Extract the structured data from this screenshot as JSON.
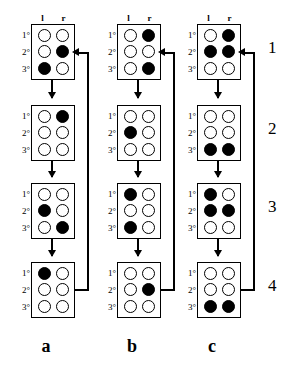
{
  "figure": {
    "panel_labels": [
      "a",
      "b",
      "c"
    ],
    "stage_numbers": [
      "1",
      "2",
      "3",
      "4"
    ],
    "column_headers": [
      "l",
      "r"
    ],
    "row_labels": [
      "1°",
      "2°",
      "3°"
    ],
    "colors": {
      "filled_dot": "#000000",
      "empty_dot": "#ffffff",
      "stroke": "#000000",
      "background": "#ffffff"
    },
    "glyph_names": {
      "down_arrow": "down-arrow-icon",
      "feedback_arrow": "feedback-arrow-icon",
      "filled_dot": "filled-dot-icon",
      "empty_dot": "empty-dot-icon"
    }
  },
  "panels": [
    {
      "label": "a",
      "stages": [
        {
          "stage": "1",
          "rows": [
            [
              0,
              0
            ],
            [
              0,
              1
            ],
            [
              1,
              0
            ]
          ]
        },
        {
          "stage": "2",
          "rows": [
            [
              0,
              1
            ],
            [
              0,
              0
            ],
            [
              0,
              0
            ]
          ]
        },
        {
          "stage": "3",
          "rows": [
            [
              0,
              0
            ],
            [
              1,
              0
            ],
            [
              0,
              1
            ]
          ]
        },
        {
          "stage": "4",
          "rows": [
            [
              1,
              0
            ],
            [
              0,
              0
            ],
            [
              0,
              0
            ]
          ]
        }
      ]
    },
    {
      "label": "b",
      "stages": [
        {
          "stage": "1",
          "rows": [
            [
              0,
              1
            ],
            [
              0,
              0
            ],
            [
              0,
              1
            ]
          ]
        },
        {
          "stage": "2",
          "rows": [
            [
              0,
              0
            ],
            [
              1,
              0
            ],
            [
              0,
              0
            ]
          ]
        },
        {
          "stage": "3",
          "rows": [
            [
              1,
              0
            ],
            [
              0,
              0
            ],
            [
              1,
              0
            ]
          ]
        },
        {
          "stage": "4",
          "rows": [
            [
              0,
              0
            ],
            [
              0,
              1
            ],
            [
              0,
              0
            ]
          ]
        }
      ]
    },
    {
      "label": "c",
      "stages": [
        {
          "stage": "1",
          "rows": [
            [
              0,
              1
            ],
            [
              1,
              1
            ],
            [
              0,
              0
            ]
          ]
        },
        {
          "stage": "2",
          "rows": [
            [
              0,
              0
            ],
            [
              0,
              0
            ],
            [
              1,
              1
            ]
          ]
        },
        {
          "stage": "3",
          "rows": [
            [
              1,
              0
            ],
            [
              1,
              1
            ],
            [
              0,
              0
            ]
          ]
        },
        {
          "stage": "4",
          "rows": [
            [
              0,
              0
            ],
            [
              0,
              0
            ],
            [
              1,
              1
            ]
          ]
        }
      ]
    }
  ]
}
